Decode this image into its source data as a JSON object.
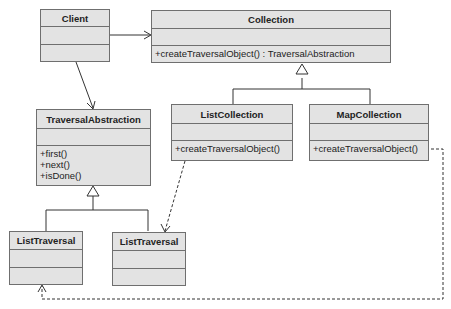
{
  "diagram": {
    "type": "UML class diagram",
    "classes": {
      "client": {
        "name": "Client",
        "operations": []
      },
      "collection": {
        "name": "Collection",
        "operations": [
          "+createTraversalObject() : TraversalAbstraction"
        ]
      },
      "traversal_abstraction": {
        "name": "TraversalAbstraction",
        "operations": [
          "+first()",
          "+next()",
          "+isDone()"
        ]
      },
      "list_collection": {
        "name": "ListCollection",
        "operations": [
          "+createTraversalObject()"
        ]
      },
      "map_collection": {
        "name": "MapCollection",
        "operations": [
          "+createTraversalObject()"
        ]
      },
      "list_traversal_1": {
        "name": "ListTraversal",
        "operations": []
      },
      "list_traversal_2": {
        "name": "ListTraversal",
        "operations": []
      }
    },
    "relations": [
      {
        "from": "Client",
        "to": "Collection",
        "kind": "association"
      },
      {
        "from": "Client",
        "to": "TraversalAbstraction",
        "kind": "association"
      },
      {
        "from": "ListCollection",
        "to": "Collection",
        "kind": "generalization"
      },
      {
        "from": "MapCollection",
        "to": "Collection",
        "kind": "generalization"
      },
      {
        "from": "ListTraversal",
        "to": "TraversalAbstraction",
        "kind": "generalization"
      },
      {
        "from": "ListTraversal",
        "to": "TraversalAbstraction",
        "kind": "generalization"
      },
      {
        "from": "ListCollection",
        "to": "ListTraversal",
        "kind": "dependency"
      },
      {
        "from": "MapCollection",
        "to": "ListTraversal",
        "kind": "dependency"
      }
    ],
    "colors": {
      "box_fill": "#e3e3e3",
      "box_border": "#6f6f6f",
      "line": "#333333"
    }
  }
}
